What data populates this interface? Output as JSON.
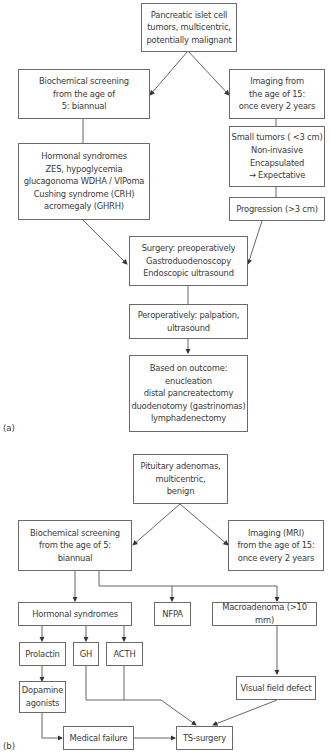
{
  "diagram_a": {
    "label": "(a)",
    "nodes": {
      "root": "Pancreatic islet cell\ntumors, multicentric,\npotentially malignant",
      "biochem": "Biochemical screening\nfrom the age of\n5: biannual",
      "imaging": "Imaging from\nthe age of 15:\nonce every 2 years",
      "hormonal": "Hormonal syndromes\nZES, hypoglycemia\nglucagonoma WDHA / VIPoma\nCushing syndrome (CRH)\nacromegaly (GHRH)",
      "small": "Small tumors ( <3 cm)\nNon-invasive\nEncapsulated\n→ Expectative",
      "progression": "Progression (>3 cm)",
      "surgery": "Surgery: preoperatively\nGastroduodenoscopy\nEndoscopic ultrasound",
      "perop": "Peroperatively: palpation,\nultrasound",
      "outcome": "Based on outcome:\nenucleation\ndistal pancreatectomy\nduodenotomy (gastrinomas)\nlymphadenectomy"
    }
  },
  "diagram_b": {
    "label": "(b)",
    "nodes": {
      "root": "Pituitary adenomas,\nmulticentric,\nbenign",
      "biochem": "Biochemical screening\nfrom the age of 5:\nbiannual",
      "imaging": "Imaging (MRI)\nfrom the age of 15:\nonce every 2 years",
      "hormonal": "Hormonal syndromes",
      "nfpa": "NFPA",
      "macro": "Macroadenoma (>10 mm)",
      "prolactin": "Prolactin",
      "gh": "GH",
      "acth": "ACTH",
      "dopamine": "Dopamine\nagonists",
      "visual": "Visual field defect",
      "failure": "Medical failure",
      "ts": "TS-surgery"
    }
  }
}
